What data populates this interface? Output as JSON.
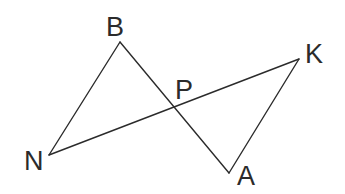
{
  "diagram": {
    "type": "geometry",
    "points": {
      "B": {
        "label": "B",
        "x": 120,
        "y": 42,
        "label_x": 106,
        "label_y": 36
      },
      "N": {
        "label": "N",
        "x": 49,
        "y": 155,
        "label_x": 24,
        "label_y": 170
      },
      "K": {
        "label": "K",
        "x": 299,
        "y": 59,
        "label_x": 305,
        "label_y": 63
      },
      "A": {
        "label": "A",
        "x": 229,
        "y": 173,
        "label_x": 237,
        "label_y": 185
      },
      "P": {
        "label": "P",
        "x": 174,
        "y": 107,
        "label_x": 175,
        "label_y": 99
      }
    },
    "segments": [
      {
        "from": "N",
        "to": "B"
      },
      {
        "from": "B",
        "to": "A"
      },
      {
        "from": "N",
        "to": "K"
      },
      {
        "from": "K",
        "to": "A"
      }
    ],
    "stroke_color": "#2b2b2b"
  }
}
